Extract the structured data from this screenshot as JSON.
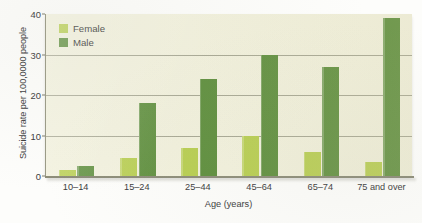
{
  "chart_data": {
    "type": "bar",
    "title": "",
    "xlabel": "Age (years)",
    "ylabel": "Suicide rate per 100,0000 people",
    "categories": [
      "10–14",
      "15–24",
      "25–44",
      "45–64",
      "65–74",
      "75 and over"
    ],
    "series": [
      {
        "name": "Female",
        "color": "#b8ce52",
        "values": [
          1.5,
          4.5,
          7,
          10,
          6,
          3.5
        ]
      },
      {
        "name": "Male",
        "color": "#5f8f3e",
        "values": [
          2.5,
          18,
          24,
          30,
          27,
          39
        ]
      }
    ],
    "ylim": [
      0,
      40
    ],
    "yticks": [
      0,
      10,
      20,
      30,
      40
    ],
    "ytick_labels": [
      "0",
      "10",
      "20",
      "30",
      "40"
    ],
    "grid": "horizontal",
    "legend_position": "top-left-inside",
    "plot_background": "#f2f1dd"
  },
  "legend": {
    "items": [
      {
        "label": "Female"
      },
      {
        "label": "Male"
      }
    ]
  }
}
